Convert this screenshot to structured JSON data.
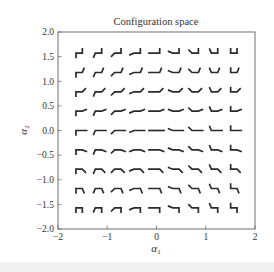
{
  "chart_data": {
    "type": "glyph-grid",
    "title": "Configuration space",
    "xlabel": "α1",
    "ylabel": "α2",
    "xlim": [
      -2,
      2
    ],
    "ylim": [
      -2,
      2
    ],
    "grid": false,
    "legend": null,
    "x_ticks": [
      -2,
      -1,
      0,
      1,
      2
    ],
    "x_tick_labels": [
      "−2",
      "−1",
      "0",
      "1",
      "2"
    ],
    "y_ticks": [
      -2.0,
      -1.5,
      -1.0,
      -0.5,
      0.0,
      0.5,
      1.0,
      1.5,
      2.0
    ],
    "y_tick_labels": [
      "−2.0",
      "−1.5",
      "−1.0",
      "−0.5",
      "0.0",
      "0.5",
      "1.0",
      "1.5",
      "2.0"
    ],
    "glyph_description": "Three-link chain at each grid point: horizontal middle link, left link rotated by α1, right link rotated by α2",
    "alpha1_values": [
      -1.5708,
      -1.1781,
      -0.7854,
      -0.3927,
      0.0,
      0.3927,
      0.7854,
      1.1781,
      1.5708
    ],
    "alpha2_values": [
      -1.5708,
      -1.1781,
      -0.7854,
      -0.3927,
      0.0,
      0.3927,
      0.7854,
      1.1781,
      1.5708
    ],
    "link_length_data_units": 0.1,
    "middle_length_data_units": 0.13
  },
  "colors": {
    "glyph": "#2b2b2b",
    "axes": "#6e6e6e",
    "text": "#333333",
    "background": "#ffffff"
  }
}
